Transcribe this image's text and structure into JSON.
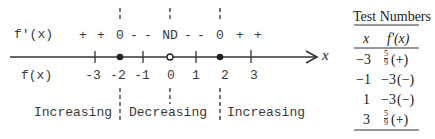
{
  "number_line": {
    "derivative_label": "f'(x)",
    "function_label": "f(x)",
    "axis_variable": "x",
    "signs": [
      {
        "text": "+",
        "x": 83
      },
      {
        "text": "+",
        "x": 101
      },
      {
        "text": "0",
        "x": 120
      },
      {
        "text": "-",
        "x": 134
      },
      {
        "text": "-",
        "x": 148
      },
      {
        "text": "ND",
        "x": 170
      },
      {
        "text": "-",
        "x": 188
      },
      {
        "text": "-",
        "x": 201
      },
      {
        "text": "0",
        "x": 220
      },
      {
        "text": "+",
        "x": 240
      },
      {
        "text": "+",
        "x": 258
      }
    ],
    "ticks": [
      {
        "label": "-3",
        "x": 95,
        "marker": "tick"
      },
      {
        "label": "-2",
        "x": 120,
        "marker": "filled-dot"
      },
      {
        "label": "-1",
        "x": 143,
        "marker": "tick"
      },
      {
        "label": "0",
        "x": 170,
        "marker": "open-dot"
      },
      {
        "label": "1",
        "x": 196,
        "marker": "tick"
      },
      {
        "label": "2",
        "x": 220,
        "marker": "filled-dot"
      },
      {
        "label": "3",
        "x": 251,
        "marker": "tick"
      }
    ],
    "critical_points": [
      -2,
      0,
      2
    ],
    "intervals": [
      {
        "label": "Increasing"
      },
      {
        "label": "Decreasing"
      },
      {
        "label": "Increasing"
      }
    ]
  },
  "test_table": {
    "title": "Test Numbers",
    "headers": [
      "x",
      "f'(x)"
    ],
    "rows": [
      {
        "x": "−3",
        "value_num": "5",
        "value_den": "9",
        "value_text": "",
        "sign": "(+)"
      },
      {
        "x": "−1",
        "value_num": "",
        "value_den": "",
        "value_text": "−3",
        "sign": "(−)"
      },
      {
        "x": "1",
        "value_num": "",
        "value_den": "",
        "value_text": "−3",
        "sign": "(−)"
      },
      {
        "x": "3",
        "value_num": "5",
        "value_den": "9",
        "value_text": "",
        "sign": "(+)"
      }
    ]
  }
}
